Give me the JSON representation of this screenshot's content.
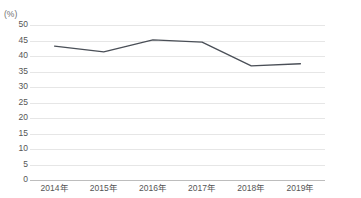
{
  "chart_data": {
    "type": "line",
    "title": "",
    "subtitle": "",
    "xlabel": "",
    "ylabel": "",
    "unit_label": "(%)",
    "categories": [
      "2014年",
      "2015年",
      "2016年",
      "2017年",
      "2018年",
      "2019年"
    ],
    "x": [
      2014,
      2015,
      2016,
      2017,
      2018,
      2019
    ],
    "series": [
      {
        "name": "",
        "values": [
          43.2,
          41.3,
          45.2,
          44.5,
          36.8,
          37.5
        ],
        "color": "#4a4f57"
      }
    ],
    "ylim": [
      0,
      50
    ],
    "yticks": [
      50,
      45,
      40,
      35,
      30,
      25,
      20,
      15,
      10,
      5,
      0
    ],
    "ytick_labels": [
      "50",
      "45",
      "40",
      "35",
      "30",
      "25",
      "20",
      "15",
      "10",
      "5",
      "0"
    ],
    "grid": true,
    "grid_color": "#e6e6e6",
    "axis_color": "#bdbdbd",
    "legend": false,
    "legend_position": "none",
    "annotations": []
  },
  "colors": {
    "line": "#4a4f57",
    "grid": "#e6e6e6",
    "axis": "#bdbdbd",
    "tick_text": "#555555",
    "unit_text": "#6f6f6f",
    "title_text": "#9aa0a6",
    "background": "#ffffff"
  }
}
